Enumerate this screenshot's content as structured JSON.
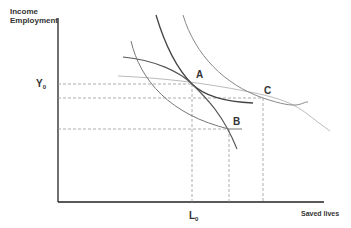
{
  "diagram": {
    "y_axis_label_line1": "Income",
    "y_axis_label_line2": "Employment",
    "x_axis_label": "Saved lives",
    "y_tick": {
      "main": "Y",
      "sub": "0"
    },
    "x_tick": {
      "main": "L",
      "sub": "0"
    },
    "points": {
      "A": "A",
      "B": "B",
      "C": "C"
    },
    "colors": {
      "axis": "#222222",
      "curve_dark": "#444444",
      "curve_mid": "#777777",
      "curve_light": "#aaaaaa",
      "dashed": "#999999"
    }
  }
}
